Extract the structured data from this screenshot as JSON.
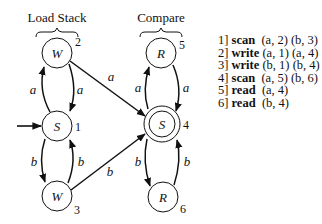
{
  "groups": [
    {
      "label": "Load Stack"
    },
    {
      "label": "Compare"
    }
  ],
  "states": [
    {
      "id": "2",
      "name": "W",
      "number": "2",
      "accepting": false
    },
    {
      "id": "1",
      "name": "S",
      "number": "1",
      "accepting": false,
      "initial": true
    },
    {
      "id": "3",
      "name": "W",
      "number": "3",
      "accepting": false
    },
    {
      "id": "5",
      "name": "R",
      "number": "5",
      "accepting": false
    },
    {
      "id": "4",
      "name": "S",
      "number": "4",
      "accepting": true
    },
    {
      "id": "6",
      "name": "R",
      "number": "6",
      "accepting": false
    }
  ],
  "edges": [
    {
      "from": "1",
      "to": "2",
      "label": "a"
    },
    {
      "from": "2",
      "to": "1",
      "label": "a"
    },
    {
      "from": "1",
      "to": "3",
      "label": "b"
    },
    {
      "from": "3",
      "to": "1",
      "label": "b"
    },
    {
      "from": "2",
      "to": "4",
      "label": "a"
    },
    {
      "from": "3",
      "to": "4",
      "label": "b"
    },
    {
      "from": "4",
      "to": "5",
      "label": "a"
    },
    {
      "from": "5",
      "to": "4",
      "label": "a"
    },
    {
      "from": "4",
      "to": "6",
      "label": "b"
    },
    {
      "from": "6",
      "to": "4",
      "label": "b"
    }
  ],
  "program": [
    {
      "line": "1]",
      "op": "scan",
      "args": "(a, 2) (b, 3)"
    },
    {
      "line": "2]",
      "op": "write",
      "args": "(a, 1) (a, 4)"
    },
    {
      "line": "3]",
      "op": "write",
      "args": "(b, 1) (b, 4)"
    },
    {
      "line": "4]",
      "op": "scan",
      "args": "(a, 5) (b, 6)"
    },
    {
      "line": "5]",
      "op": "read",
      "args": "(a, 4)"
    },
    {
      "line": "6]",
      "op": "read",
      "args": "(b, 4)"
    }
  ]
}
